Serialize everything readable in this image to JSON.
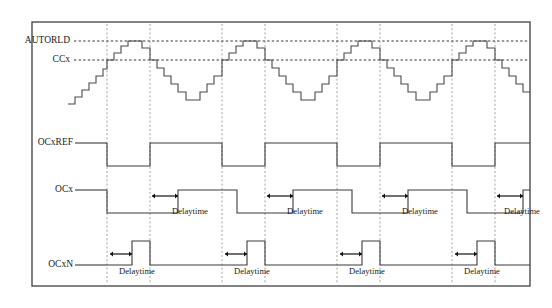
{
  "diagram": {
    "type": "timing-diagram",
    "width": 552,
    "height": 308,
    "background_color": "#ffffff",
    "frame_color": "#4d4d4d",
    "signal_color": "#3b3b3b",
    "gridline_color": "#9a9a9a",
    "level_line_color": "#1f1f1f"
  },
  "levels": [
    {
      "id": "autorld",
      "label": "AUTORLD",
      "y": 41,
      "dash_start_x": 70,
      "dash_end_x": 528
    },
    {
      "id": "ccx",
      "label": "CCx",
      "y": 60,
      "dash_start_x": 70,
      "dash_end_x": 528
    }
  ],
  "signals": [
    {
      "id": "ocxref",
      "label": "OCxREF",
      "baseline_y": 143,
      "lead_start_x": 75,
      "lead_end_x": 107
    },
    {
      "id": "ocx",
      "label": "OCx",
      "baseline_y": 190,
      "lead_start_x": 75,
      "lead_end_x": 107
    },
    {
      "id": "ocxn",
      "label": "OCxN",
      "baseline_y": 265,
      "lead_start_x": 75,
      "lead_end_x": 107
    }
  ],
  "gridlines": [
    {
      "x": 107
    },
    {
      "x": 150
    },
    {
      "x": 222
    },
    {
      "x": 265
    },
    {
      "x": 337
    },
    {
      "x": 380
    },
    {
      "x": 452
    },
    {
      "x": 495
    }
  ],
  "annotations": {
    "delaytime_text": "Delaytime",
    "ocx_delay_markers": [
      {
        "x1": 152,
        "x2": 178,
        "y": 196,
        "label_x": 190,
        "label_y": 212
      },
      {
        "x1": 267,
        "x2": 293,
        "y": 196,
        "label_x": 305,
        "label_y": 212
      },
      {
        "x1": 382,
        "x2": 408,
        "y": 196,
        "label_x": 420,
        "label_y": 212
      },
      {
        "x1": 497,
        "x2": 523,
        "y": 196,
        "label_x": 522,
        "label_y": 212
      }
    ],
    "ocxn_delay_markers": [
      {
        "x1": 110,
        "x2": 132,
        "y": 254,
        "label_x": 137,
        "label_y": 272
      },
      {
        "x1": 225,
        "x2": 247,
        "y": 254,
        "label_x": 252,
        "label_y": 272
      },
      {
        "x1": 340,
        "x2": 362,
        "y": 254,
        "label_x": 367,
        "label_y": 272
      },
      {
        "x1": 455,
        "x2": 477,
        "y": 254,
        "label_x": 482,
        "label_y": 272
      }
    ]
  },
  "waveform_paths": {
    "counter": "M 68,104 L 75,104 L 75,97 L 82,97 L 82,90 L 89,90 L 89,83 L 96,83 L 96,76 L 103,76 L 103,69 L 107,69 L 107,60 L 114,60 L 114,53 L 121,53 L 121,46 L 128,46 L 128,41 L 142,41 L 142,48 L 150,48 L 150,60 L 157,60 L 157,68 L 164,68 L 164,76 L 171,76 L 171,84 L 178,84 L 178,92 L 186,92 L 186,100 L 200,100 L 200,92 L 207,92 L 207,84 L 214,84 L 214,76 L 222,76 L 222,60 L 229,60 L 229,53 L 236,53 L 236,46 L 243,46 L 243,41 L 257,41 L 257,48 L 265,48 L 265,60 L 272,60 L 272,68 L 279,68 L 279,76 L 286,76 L 286,84 L 293,84 L 293,92 L 301,92 L 301,100 L 315,100 L 315,92 L 322,92 L 322,84 L 329,84 L 329,76 L 337,76 L 337,60 L 344,60 L 344,53 L 351,53 L 351,46 L 358,46 L 358,41 L 372,41 L 372,48 L 380,48 L 380,60 L 387,60 L 387,68 L 394,68 L 394,76 L 401,76 L 401,84 L 408,84 L 408,92 L 416,92 L 416,100 L 430,100 L 430,92 L 437,92 L 437,84 L 444,84 L 444,76 L 452,76 L 452,60 L 459,60 L 459,53 L 466,53 L 466,46 L 473,46 L 473,41 L 487,41 L 487,48 L 495,48 L 495,60 L 502,60 L 502,68 L 509,68 L 509,76 L 516,76 L 516,84 L 523,84 L 523,92 L 530,92",
    "ocxref": "M 107,143 L 107,166 L 150,166 L 150,143 L 222,143 L 222,166 L 265,166 L 265,143 L 337,143 L 337,166 L 380,166 L 380,143 L 452,143 L 452,166 L 495,166 L 495,143 L 530,143",
    "ocx": "M 107,190 L 107,213 L 178,213 L 178,190 L 237,190 L 237,213 L 293,213 L 293,190 L 352,190 L 352,213 L 408,213 L 408,190 L 467,190 L 467,213 L 523,213 L 523,190 L 530,190",
    "ocxn": "M 107,265 L 132,265 L 132,241 L 150,241 L 150,265 L 222,265 L 222,265 L 247,265 L 247,241 L 265,241 L 265,265 L 337,265 L 337,265 L 362,265 L 362,241 L 380,241 L 380,265 L 452,265 L 452,265 L 477,265 L 477,241 L 495,241 L 495,265 L 530,265"
  },
  "frame": {
    "x": 32,
    "y": 22,
    "width": 498,
    "height": 264
  }
}
